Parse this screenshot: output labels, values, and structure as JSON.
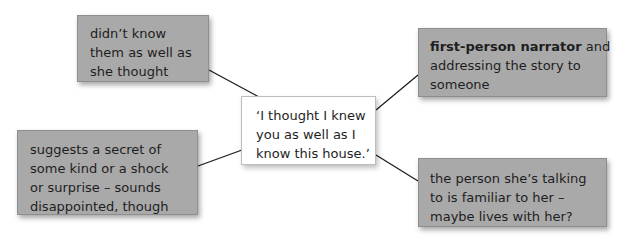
{
  "diagram": {
    "type": "annotation-mind-map",
    "center": {
      "lines": [
        "‘I thought I knew",
        "you as well as I",
        "know this house.’"
      ]
    },
    "notes": [
      {
        "id": "top-left",
        "lines": [
          "didn’t know",
          "them as well as",
          "she thought"
        ]
      },
      {
        "id": "top-right",
        "bold": "first-person narrator",
        "lines": [
          "and",
          "addressing the story to",
          "someone"
        ]
      },
      {
        "id": "bottom-left",
        "lines": [
          "suggests a secret of",
          "some kind or a shock",
          "or surprise – sounds",
          "disappointed, though"
        ]
      },
      {
        "id": "bottom-right",
        "lines": [
          "the person she’s talking",
          "to is familiar to her –",
          "maybe lives with her?"
        ]
      }
    ],
    "colors": {
      "note_fill": "#a9a9a9",
      "center_fill": "#ffffff",
      "connector": "#1e1e1e",
      "text": "#1e1e1e"
    }
  }
}
